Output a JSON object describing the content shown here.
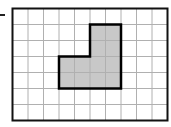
{
  "grid": {
    "columns": 10,
    "rows": 7,
    "origin_x": 12.5,
    "origin_y": 8.5,
    "cell_w": 15.5,
    "cell_h": 16,
    "grid_line_color": "#b0b0b0",
    "border_color": "#111111"
  },
  "shape": {
    "description": "L-shaped polygon of shaded grid cells",
    "fill": "#c8c8c8",
    "stroke": "#000000",
    "vertices_grid": [
      [
        5,
        1
      ],
      [
        7,
        1
      ],
      [
        7,
        5
      ],
      [
        3,
        5
      ],
      [
        3,
        3
      ],
      [
        5,
        3
      ]
    ],
    "shaded_cells": 8
  }
}
